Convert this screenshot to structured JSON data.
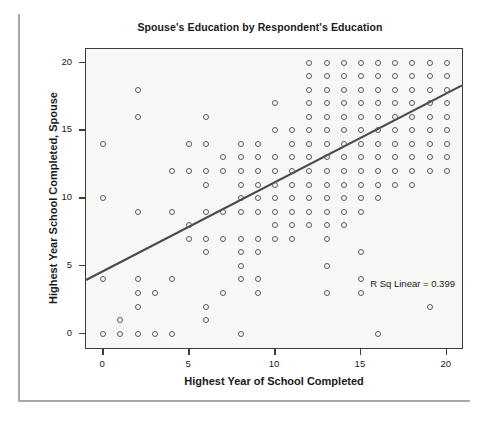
{
  "chart_data": {
    "type": "scatter",
    "title": "Spouse's Education by Respondent's Education",
    "xlabel": "Highest Year of School Completed",
    "ylabel": "Highest Year School Completed, Spouse",
    "xlim": [
      -1,
      21
    ],
    "ylim": [
      -1.2,
      21
    ],
    "xticks": [
      0,
      5,
      10,
      15,
      20
    ],
    "yticks": [
      0,
      5,
      10,
      15,
      20
    ],
    "xticklabels": [
      "0",
      "5",
      "10",
      "15",
      "20"
    ],
    "yticklabels": [
      "0",
      "5",
      "10",
      "15",
      "20"
    ],
    "grid": false,
    "legend": "none",
    "annotations": [
      {
        "name": "r-squared-annotation",
        "text": "R Sq Linear = 0.399",
        "x": 15.6,
        "y": 3.6
      }
    ],
    "fit_line": {
      "name": "linear-fit-line",
      "r_squared": 0.399,
      "color": "#4a4a4a",
      "x_start": -1,
      "y_start": 3.85,
      "x_end": 21,
      "y_end": 18.3
    },
    "marker": {
      "shape": "open-circle",
      "edge_color": "#5a5a5a",
      "fill": "none",
      "size": 6
    },
    "points": [
      [
        0,
        0
      ],
      [
        0,
        4
      ],
      [
        0,
        10
      ],
      [
        0,
        14
      ],
      [
        1,
        0
      ],
      [
        1,
        1
      ],
      [
        2,
        0
      ],
      [
        2,
        2
      ],
      [
        2,
        3
      ],
      [
        2,
        4
      ],
      [
        2,
        9
      ],
      [
        2,
        16
      ],
      [
        2,
        18
      ],
      [
        3,
        0
      ],
      [
        3,
        3
      ],
      [
        4,
        0
      ],
      [
        4,
        4
      ],
      [
        4,
        9
      ],
      [
        4,
        12
      ],
      [
        5,
        7
      ],
      [
        5,
        8
      ],
      [
        5,
        12
      ],
      [
        5,
        14
      ],
      [
        6,
        1
      ],
      [
        6,
        2
      ],
      [
        6,
        6
      ],
      [
        6,
        7
      ],
      [
        6,
        9
      ],
      [
        6,
        11
      ],
      [
        6,
        12
      ],
      [
        6,
        14
      ],
      [
        6,
        16
      ],
      [
        7,
        3
      ],
      [
        7,
        7
      ],
      [
        7,
        9
      ],
      [
        7,
        12
      ],
      [
        7,
        13
      ],
      [
        8,
        0
      ],
      [
        8,
        4
      ],
      [
        8,
        5
      ],
      [
        8,
        6
      ],
      [
        8,
        7
      ],
      [
        8,
        9
      ],
      [
        8,
        10
      ],
      [
        8,
        11
      ],
      [
        8,
        12
      ],
      [
        8,
        13
      ],
      [
        8,
        14
      ],
      [
        9,
        3
      ],
      [
        9,
        4
      ],
      [
        9,
        6
      ],
      [
        9,
        7
      ],
      [
        9,
        9
      ],
      [
        9,
        10
      ],
      [
        9,
        11
      ],
      [
        9,
        12
      ],
      [
        9,
        13
      ],
      [
        9,
        14
      ],
      [
        10,
        7
      ],
      [
        10,
        8
      ],
      [
        10,
        9
      ],
      [
        10,
        10
      ],
      [
        10,
        11
      ],
      [
        10,
        12
      ],
      [
        10,
        13
      ],
      [
        10,
        15
      ],
      [
        10,
        17
      ],
      [
        11,
        7
      ],
      [
        11,
        8
      ],
      [
        11,
        9
      ],
      [
        11,
        10
      ],
      [
        11,
        11
      ],
      [
        11,
        12
      ],
      [
        11,
        13
      ],
      [
        11,
        14
      ],
      [
        11,
        15
      ],
      [
        12,
        8
      ],
      [
        12,
        9
      ],
      [
        12,
        10
      ],
      [
        12,
        11
      ],
      [
        12,
        12
      ],
      [
        12,
        13
      ],
      [
        12,
        14
      ],
      [
        12,
        15
      ],
      [
        12,
        16
      ],
      [
        12,
        17
      ],
      [
        12,
        18
      ],
      [
        12,
        19
      ],
      [
        12,
        20
      ],
      [
        13,
        3
      ],
      [
        13,
        5
      ],
      [
        13,
        7
      ],
      [
        13,
        8
      ],
      [
        13,
        9
      ],
      [
        13,
        10
      ],
      [
        13,
        11
      ],
      [
        13,
        12
      ],
      [
        13,
        13
      ],
      [
        13,
        14
      ],
      [
        13,
        15
      ],
      [
        13,
        16
      ],
      [
        13,
        17
      ],
      [
        13,
        18
      ],
      [
        13,
        19
      ],
      [
        13,
        20
      ],
      [
        14,
        8
      ],
      [
        14,
        9
      ],
      [
        14,
        10
      ],
      [
        14,
        11
      ],
      [
        14,
        12
      ],
      [
        14,
        13
      ],
      [
        14,
        14
      ],
      [
        14,
        15
      ],
      [
        14,
        16
      ],
      [
        14,
        17
      ],
      [
        14,
        18
      ],
      [
        14,
        19
      ],
      [
        14,
        20
      ],
      [
        15,
        3
      ],
      [
        15,
        4
      ],
      [
        15,
        6
      ],
      [
        15,
        9
      ],
      [
        15,
        10
      ],
      [
        15,
        11
      ],
      [
        15,
        12
      ],
      [
        15,
        13
      ],
      [
        15,
        14
      ],
      [
        15,
        15
      ],
      [
        15,
        16
      ],
      [
        15,
        17
      ],
      [
        15,
        18
      ],
      [
        15,
        19
      ],
      [
        15,
        20
      ],
      [
        16,
        0
      ],
      [
        16,
        10
      ],
      [
        16,
        11
      ],
      [
        16,
        12
      ],
      [
        16,
        13
      ],
      [
        16,
        14
      ],
      [
        16,
        15
      ],
      [
        16,
        16
      ],
      [
        16,
        17
      ],
      [
        16,
        18
      ],
      [
        16,
        19
      ],
      [
        16,
        20
      ],
      [
        17,
        11
      ],
      [
        17,
        12
      ],
      [
        17,
        13
      ],
      [
        17,
        14
      ],
      [
        17,
        15
      ],
      [
        17,
        16
      ],
      [
        17,
        17
      ],
      [
        17,
        18
      ],
      [
        17,
        19
      ],
      [
        17,
        20
      ],
      [
        18,
        11
      ],
      [
        18,
        12
      ],
      [
        18,
        13
      ],
      [
        18,
        14
      ],
      [
        18,
        15
      ],
      [
        18,
        16
      ],
      [
        18,
        17
      ],
      [
        18,
        18
      ],
      [
        18,
        19
      ],
      [
        18,
        20
      ],
      [
        19,
        2
      ],
      [
        19,
        12
      ],
      [
        19,
        13
      ],
      [
        19,
        14
      ],
      [
        19,
        15
      ],
      [
        19,
        16
      ],
      [
        19,
        17
      ],
      [
        19,
        18
      ],
      [
        19,
        19
      ],
      [
        19,
        20
      ],
      [
        20,
        12
      ],
      [
        20,
        13
      ],
      [
        20,
        14
      ],
      [
        20,
        15
      ],
      [
        20,
        16
      ],
      [
        20,
        17
      ],
      [
        20,
        18
      ],
      [
        20,
        19
      ],
      [
        20,
        20
      ]
    ]
  }
}
